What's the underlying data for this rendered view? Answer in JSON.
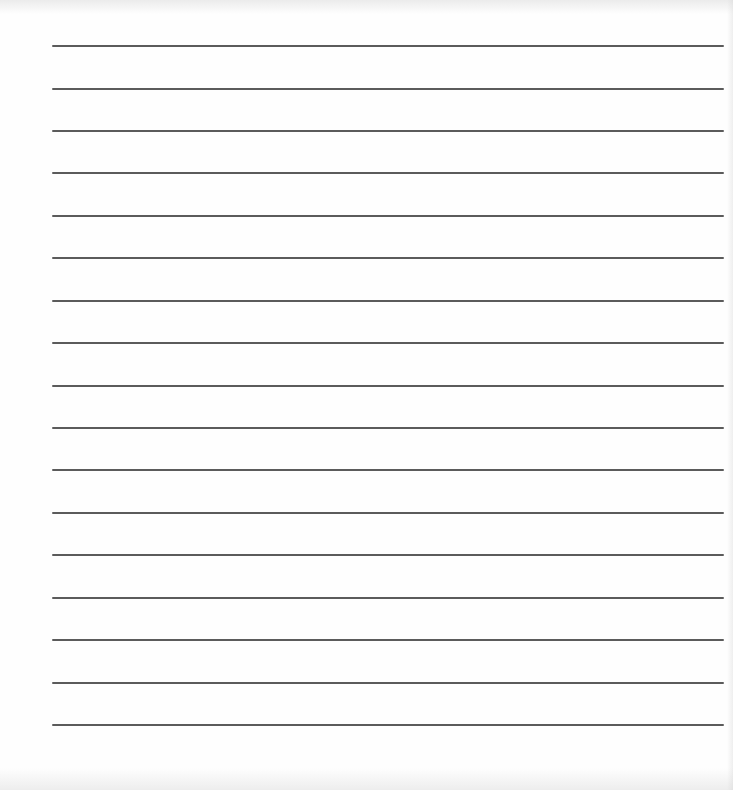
{
  "document": {
    "type": "lined-paper",
    "line_count": 17,
    "line_color": "#4d4d4d",
    "background_color": "#fefefe",
    "lines": [
      {
        "index": 1,
        "y": 46
      },
      {
        "index": 2,
        "y": 89
      },
      {
        "index": 3,
        "y": 131
      },
      {
        "index": 4,
        "y": 173
      },
      {
        "index": 5,
        "y": 216
      },
      {
        "index": 6,
        "y": 258
      },
      {
        "index": 7,
        "y": 301
      },
      {
        "index": 8,
        "y": 343
      },
      {
        "index": 9,
        "y": 386
      },
      {
        "index": 10,
        "y": 428
      },
      {
        "index": 11,
        "y": 470
      },
      {
        "index": 12,
        "y": 513
      },
      {
        "index": 13,
        "y": 555
      },
      {
        "index": 14,
        "y": 598
      },
      {
        "index": 15,
        "y": 640
      },
      {
        "index": 16,
        "y": 683
      },
      {
        "index": 17,
        "y": 725
      }
    ]
  }
}
